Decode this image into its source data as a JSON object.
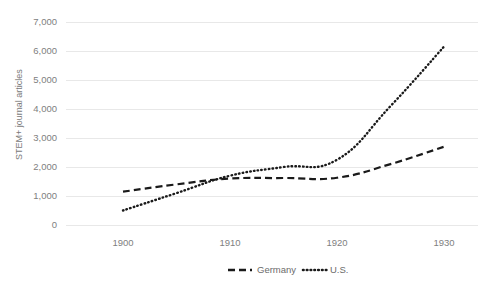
{
  "chart_data": {
    "type": "line",
    "title": "",
    "subtitle": "",
    "xlabel": "",
    "ylabel": "STEM+ journal articles",
    "x": [
      1900,
      1905,
      1910,
      1915,
      1920,
      1925,
      1930
    ],
    "xlim": [
      1898,
      1931
    ],
    "ylim": [
      0,
      7000
    ],
    "xticks": [
      1900,
      1910,
      1920,
      1930
    ],
    "xtick_labels": [
      "1900",
      "1910",
      "1920",
      "1930"
    ],
    "yticks": [
      0,
      1000,
      2000,
      3000,
      4000,
      5000,
      6000,
      7000
    ],
    "ytick_labels": [
      "0",
      "1,000",
      "2,000",
      "3,000",
      "4,000",
      "5,000",
      "6,000",
      "7,000"
    ],
    "grid": true,
    "grid_axis": "y",
    "legend_position": "bottom",
    "series": [
      {
        "name": "Germany",
        "linestyle": "dashed",
        "color": "#1a1a1a",
        "values": [
          1150,
          1400,
          1600,
          1620,
          1630,
          2100,
          2700
        ]
      },
      {
        "name": "U.S.",
        "linestyle": "dotted",
        "color": "#1a1a1a",
        "values": [
          500,
          1100,
          1700,
          2000,
          2250,
          4100,
          6150
        ]
      }
    ]
  },
  "axis": {
    "y_title": "STEM+ journal articles",
    "ytick_labels": [
      "7,000",
      "6,000",
      "5,000",
      "4,000",
      "3,000",
      "2,000",
      "1,000",
      "0"
    ],
    "xtick_labels": [
      "1900",
      "1910",
      "1920",
      "1930"
    ]
  },
  "legend": {
    "items": [
      {
        "label": "Germany",
        "marker": "dashed-line-swatch"
      },
      {
        "label": "U.S.",
        "marker": "dotted-line-swatch"
      }
    ]
  },
  "colors": {
    "series": "#1a1a1a",
    "grid": "#e8e8e8",
    "tick_text": "#808080",
    "axis_title": "#7a7a7a",
    "background": "#ffffff"
  }
}
